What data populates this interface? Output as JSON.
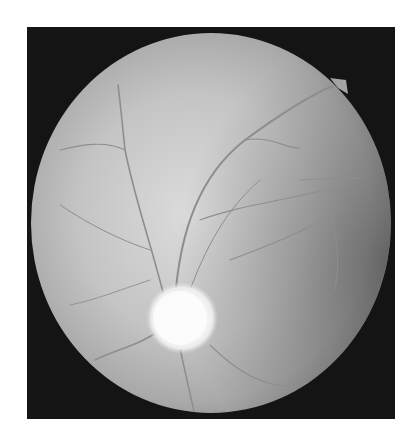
{
  "image": {
    "subject": "retinal fundus photograph",
    "mode": "grayscale",
    "background_color": "#ffffff",
    "frame_color": "#141414",
    "fundus_color": "#b8b8b8",
    "fundus_highlight_color": "#d6d6d6",
    "optic_disc_color": "#fbfbfb",
    "vessel_color": "#8c8c8c",
    "features": [
      "circular fundus field on dark square background",
      "bright optic disc lower-center-left",
      "branching retinal blood vessels",
      "small notch at upper-right rim",
      "darker vignetting toward right edge"
    ]
  }
}
